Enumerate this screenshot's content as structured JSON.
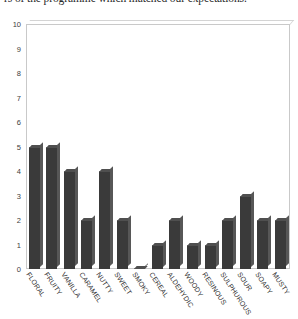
{
  "caption": {
    "text": "rs of the programme which matched our expectations."
  },
  "chart_data": {
    "type": "bar",
    "title": "",
    "xlabel": "",
    "ylabel": "",
    "ylim": [
      0,
      10
    ],
    "yticks": [
      0,
      1,
      2,
      3,
      4,
      5,
      6,
      7,
      8,
      9,
      10
    ],
    "grid": false,
    "legend": null,
    "bar_color": "#3a3a3a",
    "frame_color": "#c9c9c9",
    "categories": [
      "FLORAL",
      "FRUITY",
      "VANILLA",
      "CARAMEL",
      "NUTTY",
      "SWEET",
      "SMOKY",
      "CEREAL",
      "ALDEHYDIC",
      "WOODY",
      "RESINOUS",
      "SULPHUROUS",
      "SOUR",
      "SOAPY",
      "MUSTY"
    ],
    "values": [
      5,
      5,
      4,
      2,
      4,
      2,
      0,
      1,
      2,
      1,
      1,
      2,
      3,
      2,
      2
    ]
  }
}
